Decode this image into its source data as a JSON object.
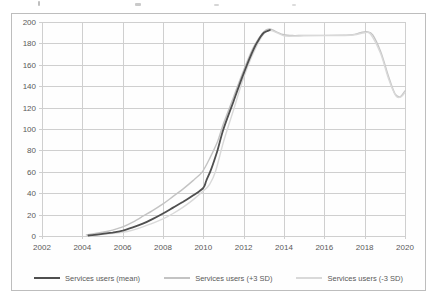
{
  "chart_data": {
    "type": "line",
    "title": "",
    "xlabel": "",
    "ylabel": "",
    "xlim": [
      2002,
      2020
    ],
    "ylim": [
      0,
      200
    ],
    "x_ticks": [
      2002,
      2004,
      2006,
      2008,
      2010,
      2012,
      2014,
      2016,
      2018,
      2020
    ],
    "y_ticks": [
      0,
      20,
      40,
      60,
      80,
      100,
      120,
      140,
      160,
      180,
      200
    ],
    "grid": true,
    "grid_color": "#cfcfcf",
    "legend_position": "bottom",
    "series": [
      {
        "name": "Services users (+3 SD)",
        "color": "#c3c3c3",
        "width": 1.4,
        "points": [
          [
            2004.2,
            1
          ],
          [
            2005,
            3.5
          ],
          [
            2005.5,
            5.5
          ],
          [
            2006,
            8.5
          ],
          [
            2006.5,
            13
          ],
          [
            2007,
            18.5
          ],
          [
            2007.5,
            24
          ],
          [
            2008,
            30
          ],
          [
            2008.5,
            37
          ],
          [
            2009,
            44
          ],
          [
            2009.5,
            52
          ],
          [
            2009.95,
            60
          ],
          [
            2010.3,
            72
          ],
          [
            2010.7,
            88
          ],
          [
            2011,
            105
          ],
          [
            2011.5,
            130
          ],
          [
            2012,
            155
          ],
          [
            2012.5,
            177
          ],
          [
            2013,
            191
          ],
          [
            2013.3,
            193.5
          ],
          [
            2013.6,
            191
          ],
          [
            2014,
            188
          ],
          [
            2014.5,
            187.3
          ],
          [
            2015,
            187.5
          ],
          [
            2016,
            187.5
          ],
          [
            2017,
            187.6
          ],
          [
            2017.4,
            188
          ],
          [
            2017.8,
            190
          ],
          [
            2018.1,
            190.8
          ],
          [
            2018.4,
            188
          ],
          [
            2018.8,
            172
          ],
          [
            2019.2,
            148
          ],
          [
            2019.5,
            133
          ],
          [
            2019.75,
            130
          ],
          [
            2020,
            135.5
          ]
        ]
      },
      {
        "name": "Services users (-3 SD)",
        "color": "#d9d9d9",
        "width": 1.4,
        "points": [
          [
            2004.4,
            0.3
          ],
          [
            2005,
            1.5
          ],
          [
            2006,
            3.5
          ],
          [
            2006.5,
            5.5
          ],
          [
            2007,
            8.5
          ],
          [
            2007.5,
            12
          ],
          [
            2008,
            16
          ],
          [
            2008.5,
            21
          ],
          [
            2009,
            27
          ],
          [
            2009.5,
            34
          ],
          [
            2010,
            42
          ],
          [
            2010.3,
            48
          ],
          [
            2010.6,
            60
          ],
          [
            2011,
            88
          ],
          [
            2011.5,
            118
          ],
          [
            2012,
            148
          ],
          [
            2012.5,
            172
          ],
          [
            2013,
            189
          ],
          [
            2013.35,
            192
          ],
          [
            2013.7,
            189.5
          ],
          [
            2014,
            187
          ],
          [
            2014.5,
            186.8
          ],
          [
            2015,
            187.2
          ],
          [
            2016,
            187.3
          ],
          [
            2017,
            187.4
          ],
          [
            2017.5,
            188
          ],
          [
            2018,
            190
          ],
          [
            2018.3,
            188.5
          ],
          [
            2018.8,
            170
          ],
          [
            2019.2,
            146
          ],
          [
            2019.55,
            131
          ],
          [
            2019.8,
            130
          ],
          [
            2020,
            134.5
          ]
        ]
      },
      {
        "name": "Services users (mean)",
        "color": "#4f4f4f",
        "width": 1.8,
        "points": [
          [
            2004.3,
            0.5
          ],
          [
            2004.6,
            1
          ],
          [
            2005,
            2
          ],
          [
            2005.5,
            3.2
          ],
          [
            2006,
            5
          ],
          [
            2006.5,
            8
          ],
          [
            2007,
            11.5
          ],
          [
            2007.5,
            16
          ],
          [
            2008,
            21
          ],
          [
            2008.5,
            26.5
          ],
          [
            2009,
            32
          ],
          [
            2009.5,
            38
          ],
          [
            2010,
            45
          ],
          [
            2010.15,
            52
          ],
          [
            2010.4,
            63
          ],
          [
            2010.7,
            80
          ],
          [
            2011,
            100
          ],
          [
            2011.5,
            126
          ],
          [
            2012,
            152
          ],
          [
            2012.5,
            175
          ],
          [
            2012.8,
            185
          ],
          [
            2013,
            190
          ],
          [
            2013.3,
            192.5
          ]
        ]
      }
    ],
    "legend_order": [
      "Services users (mean)",
      "Services users (+3 SD)",
      "Services users (-3 SD)"
    ]
  }
}
